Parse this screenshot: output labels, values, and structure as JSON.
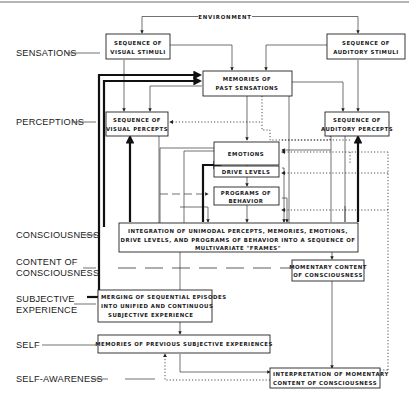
{
  "diagram": {
    "top_label": "ENVIRONMENT",
    "levels": [
      {
        "id": "sensations",
        "lines": [
          "SENSATIONS"
        ]
      },
      {
        "id": "perceptions",
        "lines": [
          "PERCEPTIONS"
        ]
      },
      {
        "id": "consciousness",
        "lines": [
          "CONSCIOUSNESS"
        ]
      },
      {
        "id": "content",
        "lines": [
          "CONTENT OF",
          "CONSCIOUSNESS"
        ]
      },
      {
        "id": "subjective",
        "lines": [
          "SUBJECTIVE",
          "EXPERIENCE"
        ]
      },
      {
        "id": "self",
        "lines": [
          "SELF"
        ]
      },
      {
        "id": "selfaware",
        "lines": [
          "SELF-AWARENESS"
        ]
      }
    ],
    "boxes": {
      "visual_stimuli": [
        "SEQUENCE OF",
        "VISUAL STIMULI"
      ],
      "auditory_stimuli": [
        "SEQUENCE OF",
        "AUDITORY STIMULI"
      ],
      "memories_past": [
        "MEMORIES OF",
        "PAST SENSATIONS"
      ],
      "visual_percepts": [
        "SEQUENCE OF",
        "VISUAL PERCEPTS"
      ],
      "auditory_percepts": [
        "SEQUENCE OF",
        "AUDITORY PERCEPTS"
      ],
      "emotions": [
        "EMOTIONS"
      ],
      "drive_levels": [
        "DRIVE LEVELS"
      ],
      "programs": [
        "PROGRAMS OF",
        "BEHAVIOR"
      ],
      "integration": [
        "INTEGRATION OF UNIMODAL PERCEPTS, MEMORIES, EMOTIONS,",
        "DRIVE LEVELS, AND PROGRAMS OF BEHAVIOR INTO A SEQUENCE OF",
        "MULTIVARIATE \"FRAMES\""
      ],
      "momentary": [
        "MOMENTARY CONTENT",
        "OF CONSCIOUSNESS"
      ],
      "merging": [
        "MERGING OF SEQUENTIAL EPISODES",
        "INTO UNIFIED AND CONTINUOUS",
        "SUBJECTIVE EXPERIENCE"
      ],
      "memories_prev": [
        "MEMORIES OF PREVIOUS SUBJECTIVE EXPERIENCES"
      ],
      "interpretation": [
        "INTERPRETATION OF MOMENTARY",
        "CONTENT OF CONSCIOUSNESS"
      ]
    },
    "colors": {
      "ink": "#1a1a1a",
      "background": "#ffffff"
    }
  }
}
